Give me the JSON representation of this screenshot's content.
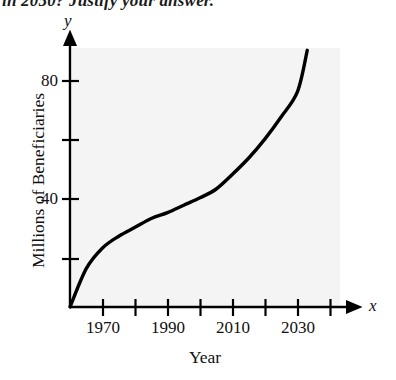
{
  "figure": {
    "cutoff_header_text": "in 2050? Justify your answer.",
    "background_color": "#ffffff",
    "plot_background_color": "#f4f4f4",
    "curve_color": "#000000",
    "axis_color": "#000000"
  },
  "axes": {
    "y_variable_label": "y",
    "x_variable_label": "x"
  },
  "chart_data": {
    "type": "line",
    "title": "",
    "subtitle": "",
    "xlabel": "Year",
    "ylabel": "Millions of Beneficiaries",
    "xlim": [
      1960,
      2035
    ],
    "ylim": [
      0,
      92
    ],
    "grid": false,
    "legend": null,
    "legend_position": "none",
    "x_tick_values": [
      1970,
      1980,
      1990,
      2000,
      2010,
      2020,
      2030,
      2040
    ],
    "x_tick_labels": [
      "1970",
      "",
      "1990",
      "",
      "2010",
      "",
      "2030",
      ""
    ],
    "x_visible_tick_labels": [
      "1970",
      "1990",
      "2010",
      "2030"
    ],
    "y_tick_values": [
      20,
      40,
      60,
      80
    ],
    "y_tick_labels": [
      "",
      "40",
      "",
      "80"
    ],
    "y_visible_tick_labels": [
      "40",
      "80"
    ],
    "series": [
      {
        "name": "Millions of Beneficiaries",
        "x": [
          1960,
          1965,
          1970,
          1975,
          1980,
          1985,
          1990,
          1995,
          2000,
          2005,
          2010,
          2015,
          2020,
          2025,
          2030,
          2033
        ],
        "values": [
          0,
          13,
          20,
          24,
          27,
          30,
          32,
          34.5,
          37,
          40,
          45,
          50.5,
          57,
          64.5,
          73,
          87
        ]
      }
    ],
    "annotations": []
  }
}
